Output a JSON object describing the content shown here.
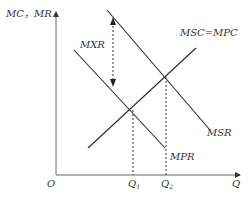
{
  "diagram": {
    "type": "economics-externality",
    "y_axis_label": "MC，MR",
    "x_axis_label": "Q",
    "origin_label": "O",
    "curves": [
      {
        "id": "msr",
        "label": "MSR",
        "slope": "down"
      },
      {
        "id": "mpr",
        "label": "MPR",
        "slope": "down"
      },
      {
        "id": "msc",
        "label": "MSC=MPC",
        "slope": "up"
      }
    ],
    "externality_label": "MXR",
    "quantities": [
      {
        "label": "Q",
        "subscript": "1",
        "meaning": "MPR = MSC=MPC intersection"
      },
      {
        "label": "Q",
        "subscript": "2",
        "meaning": "MSR = MSC=MPC intersection"
      }
    ],
    "colors": {
      "line": "#2a2a2a",
      "axis": "#555555",
      "text": "#333333"
    }
  }
}
